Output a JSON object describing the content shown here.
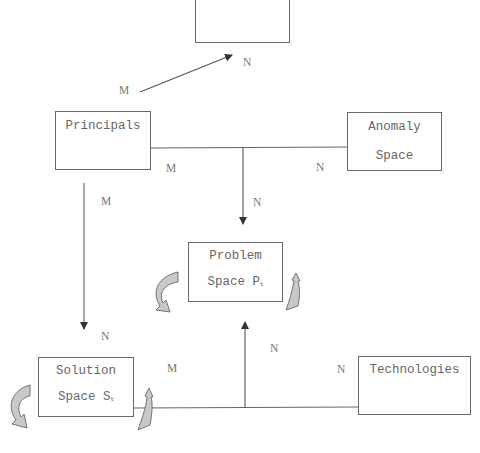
{
  "diagram": {
    "nodes": [
      {
        "id": "top",
        "label": ""
      },
      {
        "id": "principals",
        "label": "Principals"
      },
      {
        "id": "anomaly",
        "line1": "Anomaly",
        "line2": "Space"
      },
      {
        "id": "problem",
        "line1": "Problem",
        "line2": "Space P",
        "sub": "t"
      },
      {
        "id": "solution",
        "line1": "Solution",
        "line2": "Space S",
        "sub": "t"
      },
      {
        "id": "technologies",
        "label": "Technologies"
      }
    ],
    "cardinalities": {
      "principals_to_top_m": "M",
      "principals_to_top_n": "N",
      "principals_junction_m": "M",
      "anomaly_junction_n": "N",
      "junction_to_problem_n": "N",
      "principals_to_solution_m": "M",
      "principals_to_solution_n": "N",
      "solution_junction_m": "M",
      "junction_to_problem_up_n": "N",
      "technologies_junction_n": "N"
    },
    "edges": [
      {
        "from": "principals",
        "to": "top",
        "type": "arrow",
        "card": [
          "M",
          "N"
        ]
      },
      {
        "from": "principals+anomaly",
        "to": "problem",
        "type": "ternary-arrow",
        "card": [
          "M",
          "N",
          "N"
        ]
      },
      {
        "from": "principals",
        "to": "solution",
        "type": "arrow",
        "card": [
          "M",
          "N"
        ]
      },
      {
        "from": "solution+technologies",
        "to": "problem",
        "type": "ternary-arrow",
        "card": [
          "M",
          "N",
          "N"
        ]
      }
    ],
    "self_loops": [
      "problem",
      "solution"
    ]
  }
}
